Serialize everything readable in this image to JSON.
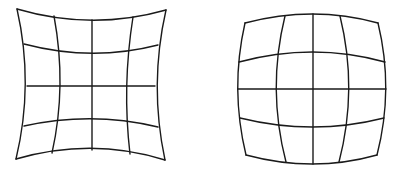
{
  "figure": {
    "type": "lens-distortion-comparison",
    "stroke_color": "#1a1a1a",
    "background": "#ffffff",
    "panels": [
      {
        "id": "pincushion",
        "label": "pincushion distortion grid",
        "grid": "4x4 cells",
        "outer": {
          "top": "M17,9 Q92,31 166,10",
          "bottom": "M16,159 Q92,137 165,160",
          "left": "M17,9 Q34,84 16,159",
          "right": "M166,10 Q149,85 165,160"
        },
        "rows": [
          "M24,44 Q92,62 158,45",
          "M27,86 L155,86",
          "M24,126 Q92,111 158,127"
        ],
        "cols": [
          "M54,16 Q67,86 52,153",
          "M92,20 L92,150",
          "M133,17 Q122,86 130,154"
        ]
      },
      {
        "id": "barrel",
        "label": "barrel distortion grid",
        "grid": "4x4 cells",
        "outer": {
          "top": "M245,23 Q313,5 378,23",
          "bottom": "M246,155 Q313,173 377,155",
          "left": "M245,23 Q230,89 246,155",
          "right": "M378,23 Q394,89 377,155"
        },
        "rows": [
          "M239,62 Q313,42 385,62",
          "M238,89 L386,89",
          "M240,118 Q313,136 384,118"
        ],
        "cols": [
          "M285,16 Q267,89 286,162",
          "M313,14 L313,164",
          "M340,16 Q358,89 339,162"
        ]
      }
    ]
  }
}
